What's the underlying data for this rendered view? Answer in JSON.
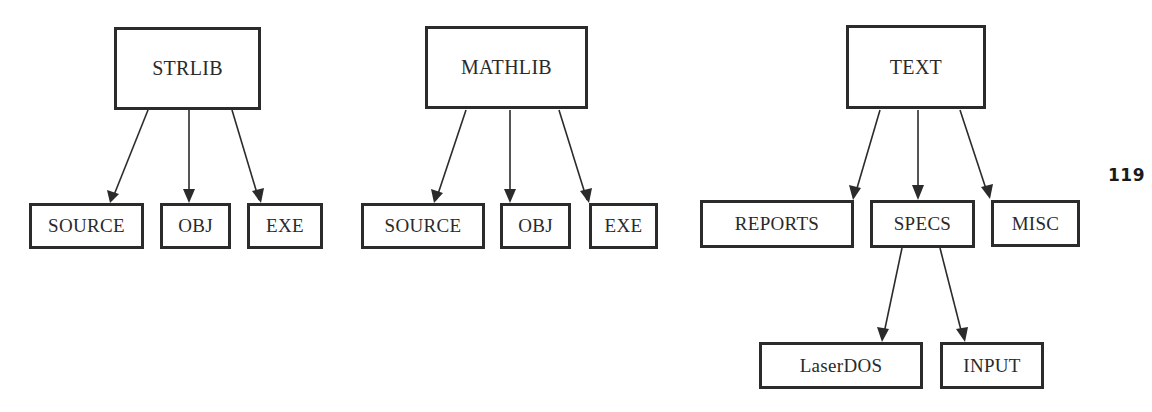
{
  "page": {
    "number": "119"
  },
  "trees": [
    {
      "root": {
        "label": "STRLIB"
      },
      "children": [
        {
          "label": "SOURCE"
        },
        {
          "label": "OBJ"
        },
        {
          "label": "EXE"
        }
      ]
    },
    {
      "root": {
        "label": "MATHLIB"
      },
      "children": [
        {
          "label": "SOURCE"
        },
        {
          "label": "OBJ"
        },
        {
          "label": "EXE"
        }
      ]
    },
    {
      "root": {
        "label": "TEXT"
      },
      "children": [
        {
          "label": "REPORTS"
        },
        {
          "label": "SPECS",
          "children": [
            {
              "label": "LaserDOS"
            },
            {
              "label": "INPUT"
            }
          ]
        },
        {
          "label": "MISC"
        }
      ]
    }
  ],
  "colors": {
    "stroke": "#2b2b2b",
    "background": "#ffffff"
  }
}
